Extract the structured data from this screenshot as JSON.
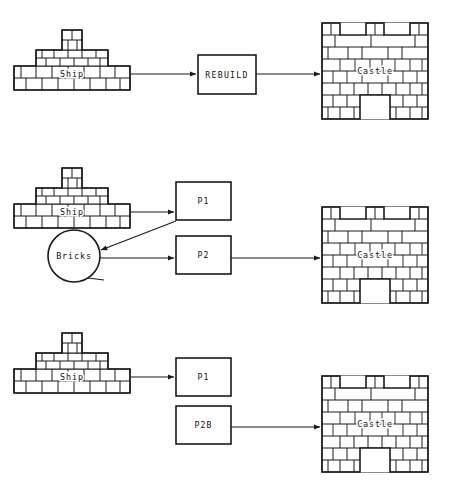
{
  "diagram": {
    "background_color": "#ffffff",
    "line_color": "#1a1a1a",
    "rows": [
      {
        "id": "row-1",
        "name": "single-step-rebuild",
        "nodes": [
          {
            "id": "ship-1",
            "type": "ship-shape",
            "label": "Ship"
          },
          {
            "id": "rebuild-1",
            "type": "process-box",
            "label": "REBUILD"
          },
          {
            "id": "castle-1",
            "type": "castle-shape",
            "label": "Castle"
          }
        ],
        "edges": [
          {
            "from": "ship-1",
            "to": "rebuild-1",
            "arrow": true
          },
          {
            "from": "rebuild-1",
            "to": "castle-1",
            "arrow": true
          }
        ]
      },
      {
        "id": "row-2",
        "name": "two-step-rebuild-with-bricks",
        "nodes": [
          {
            "id": "ship-2",
            "type": "ship-shape",
            "label": "Ship"
          },
          {
            "id": "bricks-2",
            "type": "circle-node",
            "label": "Bricks"
          },
          {
            "id": "p1-2",
            "type": "process-box",
            "label": "P1"
          },
          {
            "id": "p2-2",
            "type": "process-box",
            "label": "P2"
          },
          {
            "id": "castle-2",
            "type": "castle-shape",
            "label": "Castle"
          }
        ],
        "edges": [
          {
            "from": "ship-2",
            "to": "p1-2",
            "arrow": true
          },
          {
            "from": "p1-2",
            "to": "bricks-2",
            "arrow": true
          },
          {
            "from": "bricks-2",
            "to": "p2-2",
            "arrow": true
          },
          {
            "from": "p2-2",
            "to": "castle-2",
            "arrow": true
          }
        ]
      },
      {
        "id": "row-3",
        "name": "disconnected-rebuild",
        "nodes": [
          {
            "id": "ship-3",
            "type": "ship-shape",
            "label": "Ship"
          },
          {
            "id": "p1-3",
            "type": "process-box",
            "label": "P1"
          },
          {
            "id": "p2b-3",
            "type": "process-box",
            "label": "P2B"
          },
          {
            "id": "castle-3",
            "type": "castle-shape",
            "label": "Castle"
          }
        ],
        "edges": [
          {
            "from": "ship-3",
            "to": "p1-3",
            "arrow": true
          },
          {
            "from": "p2b-3",
            "to": "castle-3",
            "arrow": true
          }
        ]
      }
    ],
    "labels": {
      "ship": "Ship",
      "castle": "Castle",
      "bricks": "Bricks",
      "rebuild": "REBUILD",
      "p1": "P1",
      "p2": "P2",
      "p2b": "P2B"
    }
  }
}
